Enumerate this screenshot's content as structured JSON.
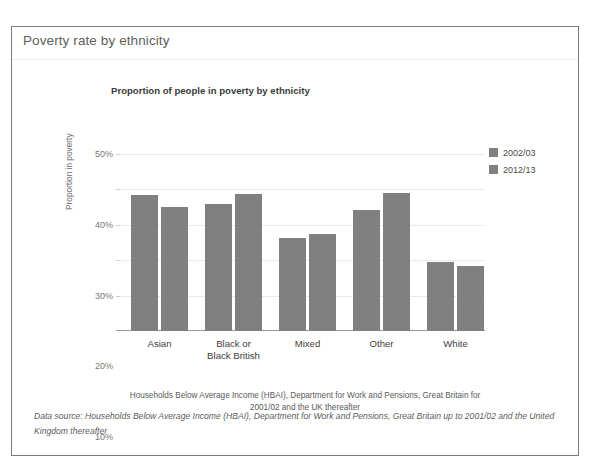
{
  "header": {
    "title": "Poverty rate by ethnicity"
  },
  "chart_data": {
    "type": "bar",
    "title": "Proportion of people in poverty by ethnicity",
    "xlabel": "",
    "ylabel": "Proportion in poverty",
    "ylim": [
      0,
      50
    ],
    "ytick_labels": [
      "50%",
      "40%",
      "30%",
      "20%",
      "10%"
    ],
    "ytick_values": [
      50,
      40,
      30,
      20,
      10
    ],
    "grid": true,
    "legend_position": "top-right",
    "categories": [
      "Asian",
      "Black or\nBlack British",
      "Mixed",
      "Other",
      "White"
    ],
    "category_labels": [
      {
        "line1": "Asian",
        "line2": ""
      },
      {
        "line1": "Black or",
        "line2": "Black British"
      },
      {
        "line1": "Mixed",
        "line2": ""
      },
      {
        "line1": "Other",
        "line2": ""
      },
      {
        "line1": "White",
        "line2": ""
      }
    ],
    "series": [
      {
        "name": "2002/03",
        "color": "#808080",
        "values": [
          38.5,
          36.0,
          26.2,
          34.3,
          19.6
        ]
      },
      {
        "name": "2012/13",
        "color": "#808080",
        "values": [
          35.0,
          38.8,
          27.3,
          39.0,
          18.5
        ]
      }
    ],
    "footnote": "Households Below Average Income (HBAI), Department for Work and Pensions, Great Britain for 2001/02 and the UK thereafter"
  },
  "footer": {
    "data_source": "Data source: Households Below Average Income (HBAI), Department for Work and Pensions, Great Britain up to 2001/02 and the United Kingdom thereafter"
  }
}
